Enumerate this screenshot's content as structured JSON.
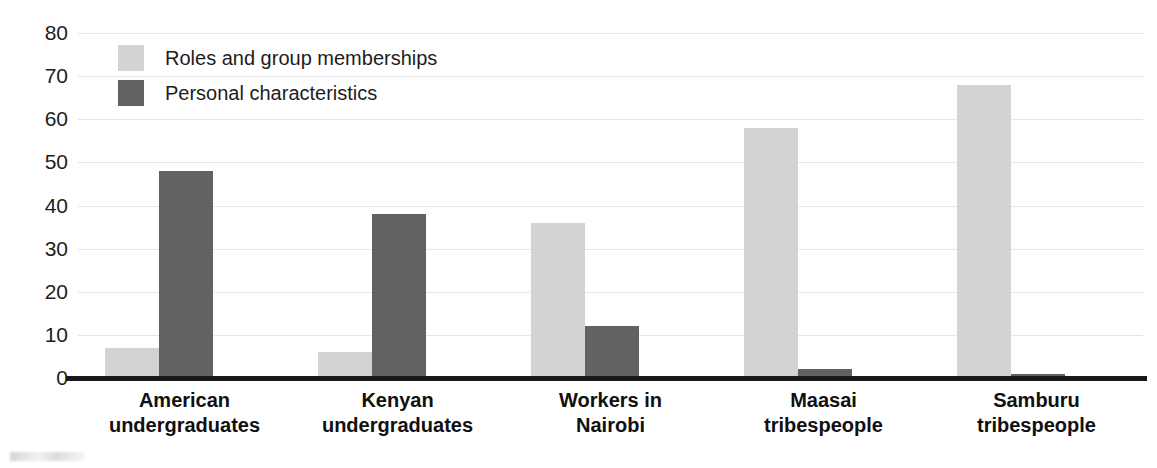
{
  "chart_data": {
    "type": "bar",
    "title": "",
    "xlabel": "",
    "ylabel": "",
    "ylim": [
      0,
      80
    ],
    "ytick_step": 10,
    "ytick_labels": [
      "80",
      "70",
      "60",
      "50",
      "40",
      "30",
      "20",
      "10",
      "0"
    ],
    "grid": true,
    "legend_position": "top-left-inside",
    "categories": [
      "American undergraduates",
      "Kenyan undergraduates",
      "Workers in Nairobi",
      "Maasai tribespeople",
      "Samburu tribespeople"
    ],
    "category_lines": [
      [
        "American",
        "undergraduates"
      ],
      [
        "Kenyan",
        "undergraduates"
      ],
      [
        "Workers in",
        "Nairobi"
      ],
      [
        "Maasai",
        "tribespeople"
      ],
      [
        "Samburu",
        "tribespeople"
      ]
    ],
    "series": [
      {
        "name": "Roles and group memberships",
        "color": "#d3d3d3",
        "values": [
          7,
          6,
          36,
          58,
          68
        ]
      },
      {
        "name": "Personal characteristics",
        "color": "#626262",
        "values": [
          48,
          38,
          12,
          2,
          1
        ]
      }
    ]
  },
  "legend": {
    "items": [
      {
        "label": "Roles and group memberships",
        "swatch": "legend-swatch-light"
      },
      {
        "label": "Personal characteristics",
        "swatch": "legend-swatch-dark"
      }
    ]
  },
  "axis": {
    "y_ticks": [
      "80",
      "70",
      "60",
      "50",
      "40",
      "30",
      "20",
      "10",
      "0"
    ]
  }
}
